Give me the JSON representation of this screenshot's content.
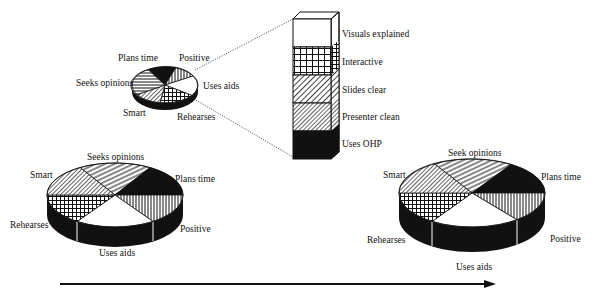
{
  "diagram": {
    "small_pie": {
      "slices": [
        {
          "label": "Plans time",
          "pattern": "solid-dark"
        },
        {
          "label": "Positive",
          "pattern": "vertical-lines"
        },
        {
          "label": "Uses aids",
          "pattern": "white"
        },
        {
          "label": "Rehearses",
          "pattern": "grid"
        },
        {
          "label": "Smart",
          "pattern": "fine-diagonal"
        },
        {
          "label": "Seeks opinions",
          "pattern": "horizontal-lines"
        }
      ]
    },
    "column": {
      "segments": [
        {
          "label": "Visuals explained",
          "pattern": "white"
        },
        {
          "label": "Interactive",
          "pattern": "grid"
        },
        {
          "label": "Slides clear",
          "pattern": "diagonal"
        },
        {
          "label": "Presenter clean",
          "pattern": "diagonal-fine"
        },
        {
          "label": "Uses OHP",
          "pattern": "solid-dark"
        }
      ]
    },
    "left_pie": {
      "slices": [
        {
          "label": "Seeks opinions",
          "pattern": "diagonal-lines"
        },
        {
          "label": "Plans time",
          "pattern": "solid-dark"
        },
        {
          "label": "Positive",
          "pattern": "vertical-lines"
        },
        {
          "label": "Uses aids",
          "pattern": "white"
        },
        {
          "label": "Rehearses",
          "pattern": "grid"
        },
        {
          "label": "Smart",
          "pattern": "fine-diagonal"
        }
      ]
    },
    "right_pie": {
      "slices": [
        {
          "label": "Seek opinions",
          "pattern": "diagonal-lines"
        },
        {
          "label": "Plans time",
          "pattern": "solid-dark"
        },
        {
          "label": "Positive",
          "pattern": "vertical-lines"
        },
        {
          "label": "Uses aids",
          "pattern": "white"
        },
        {
          "label": "Rehearses",
          "pattern": "grid"
        },
        {
          "label": "Smart",
          "pattern": "fine-diagonal"
        }
      ]
    },
    "arrow": {
      "direction": "right"
    },
    "colors": {
      "ink": "#111111",
      "paper": "#ffffff"
    }
  }
}
